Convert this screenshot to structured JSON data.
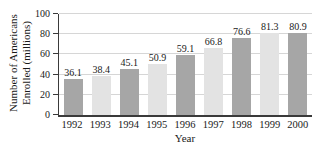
{
  "chart_data": {
    "type": "bar",
    "categories": [
      "1992",
      "1993",
      "1994",
      "1995",
      "1996",
      "1997",
      "1998",
      "1999",
      "2000"
    ],
    "values": [
      36.1,
      38.4,
      45.1,
      50.9,
      59.1,
      66.8,
      76.6,
      81.3,
      80.9
    ],
    "value_labels": [
      "36.1",
      "38.4",
      "45.1",
      "50.9",
      "59.1",
      "66.8",
      "76.6",
      "81.3",
      "80.9"
    ],
    "title": "",
    "xlabel": "Year",
    "ylabel": "Number of Americans Enrolled (millions)",
    "ylabel_lines": [
      "Number of Americans",
      "Enrolled (millions)"
    ],
    "ylim": [
      0,
      100
    ],
    "yticks": [
      0,
      20,
      40,
      60,
      80,
      100
    ],
    "grid": true,
    "legend": null,
    "colors": {
      "bar_even_year": "#a6a6a6",
      "bar_odd_year": "#e3e3e3",
      "axis": "#3a3a3a",
      "gridline": "#d6d6d6",
      "text": "#1a1a1a",
      "background": "#ffffff"
    }
  }
}
